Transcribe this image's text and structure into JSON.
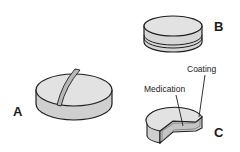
{
  "colors": {
    "outline": "#1e1e1e",
    "top_face": "#e2e2e2",
    "side_face": "#cfcfcf",
    "score": "#b8b8b8",
    "medication": "#c4c4c4",
    "background": "#ffffff"
  },
  "tablets": [
    {
      "id": "A",
      "label": "A",
      "description": "Scored tablet"
    },
    {
      "id": "B",
      "label": "B",
      "description": "Layered tablet"
    },
    {
      "id": "C",
      "label": "C",
      "description": "Coated tablet (cut-away)",
      "callouts": [
        {
          "label": "Coating"
        },
        {
          "label": "Medication"
        }
      ]
    }
  ]
}
